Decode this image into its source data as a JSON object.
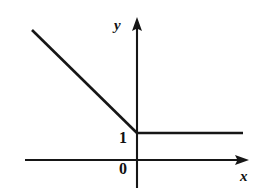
{
  "figure": {
    "width": 267,
    "height": 195,
    "background_color": "#ffffff",
    "ink_color": "#161616"
  },
  "axes": {
    "x_axis": {
      "label": "x",
      "label_name": "x-axis-label",
      "line": {
        "x1": 25,
        "y1": 160,
        "x2": 243,
        "y2": 160
      },
      "arrow": "right",
      "arrow_tip_x": 249
    },
    "y_axis": {
      "label": "y",
      "label_name": "y-axis-label",
      "line": {
        "x1": 137,
        "y1": 188,
        "x2": 137,
        "y2": 23
      },
      "arrow": "up",
      "arrow_tip_y": 17
    },
    "origin_label": "0",
    "y_tick_label": "1"
  },
  "chart_data": {
    "type": "line",
    "title": "",
    "xlabel": "x",
    "ylabel": "y",
    "grid": false,
    "legend": null,
    "origin_label": "0",
    "x_tick_labels": [],
    "y_tick_labels": [
      "1"
    ],
    "annotations": [
      "1",
      "0"
    ],
    "series": [
      {
        "name": "f(x)",
        "style": "solid",
        "color": "#161616",
        "points_pixels": [
          {
            "x": 32,
            "y": 30
          },
          {
            "x": 137,
            "y": 133
          },
          {
            "x": 243,
            "y": 133
          }
        ],
        "points_data": [
          {
            "x": -2.1,
            "y": 3.1
          },
          {
            "x": 0,
            "y": 1
          },
          {
            "x": 2.1,
            "y": 1
          }
        ],
        "segments": [
          {
            "kind": "descending-ray",
            "from": "upper-left",
            "to": "vertex at (0, 1)",
            "slope": -1
          },
          {
            "kind": "horizontal-ray",
            "from": "vertex at (0, 1)",
            "to": "right edge",
            "slope": 0,
            "constant_y": 1
          }
        ]
      }
    ],
    "vertex": {
      "x": 0,
      "y": 1
    },
    "xlim": [
      -2.2,
      2.2
    ],
    "ylim": [
      -0.6,
      3.2
    ]
  }
}
